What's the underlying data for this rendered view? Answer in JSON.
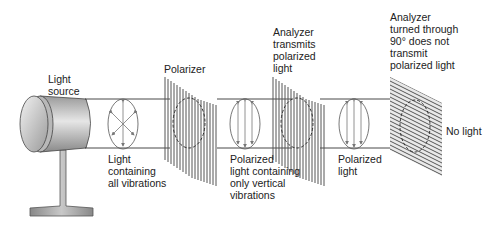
{
  "diagram": {
    "labels": {
      "light_source": "Light\nsource",
      "polarizer": "Polarizer",
      "all_vibrations": "Light\ncontaining\nall vibrations",
      "vertical_vibrations": "Polarized\nlight containing\nonly vertical\nvibrations",
      "analyzer_transmits": "Analyzer\ntransmits\npolarized\nlight",
      "polarized_light": "Polarized\nlight",
      "analyzer_turned": "Analyzer\nturned through\n90° does not\ntransmit\npolarized light",
      "no_light": "No light"
    },
    "colors": {
      "line": "#333333",
      "grating": "#555555",
      "source_body": "#aaaaaa",
      "arrow": "#777777"
    }
  }
}
